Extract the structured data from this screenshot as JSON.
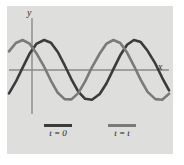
{
  "figure": {
    "background_color": "#ffffff",
    "panel_color": "#dededd"
  },
  "axes": {
    "y_label": "y",
    "x_label": "x"
  },
  "legend": {
    "items": [
      {
        "label": "t = 0",
        "color": "#3b3b3b",
        "swatch": "line-sample-dark"
      },
      {
        "label": "t = t",
        "color": "#7a7a7a",
        "swatch": "line-sample-light"
      }
    ]
  },
  "chart_data": {
    "type": "line",
    "title": "",
    "xlabel": "x",
    "ylabel": "y",
    "grid": false,
    "legend_position": "bottom",
    "xlim": [
      0,
      166
    ],
    "ylim": [
      -1.15,
      1.15
    ],
    "amplitude": 1.0,
    "wavelength_px": 57,
    "series": [
      {
        "name": "t = 0",
        "color": "#3b3b3b",
        "phase_shift_px": 0,
        "description": "sine wave at initial time",
        "x": [
          0,
          7,
          14,
          21,
          28,
          36,
          43,
          50,
          57,
          64,
          71,
          78,
          85,
          93,
          100,
          107,
          114,
          121,
          128,
          135,
          142,
          150,
          157,
          164
        ],
        "y": [
          -0.78,
          -0.39,
          0.08,
          0.54,
          0.87,
          1.0,
          0.91,
          0.6,
          0.16,
          -0.31,
          -0.72,
          -0.96,
          -0.99,
          -0.8,
          -0.44,
          0.03,
          0.49,
          0.84,
          1.0,
          0.93,
          0.64,
          0.21,
          -0.26,
          -0.68
        ]
      },
      {
        "name": "t = t",
        "color": "#7a7a7a",
        "phase_shift_px": 22,
        "description": "same wave translated to the right after time t",
        "x": [
          0,
          7,
          14,
          21,
          28,
          36,
          43,
          50,
          57,
          64,
          71,
          78,
          85,
          93,
          100,
          107,
          114,
          121,
          128,
          135,
          142,
          150,
          157,
          164
        ],
        "y": [
          0.62,
          0.9,
          1.0,
          0.88,
          0.56,
          0.11,
          -0.36,
          -0.76,
          -0.97,
          -0.98,
          -0.77,
          -0.38,
          0.09,
          0.55,
          0.88,
          1.0,
          0.9,
          0.58,
          0.14,
          -0.33,
          -0.73,
          -0.97,
          -0.99,
          -0.79
        ]
      }
    ]
  }
}
